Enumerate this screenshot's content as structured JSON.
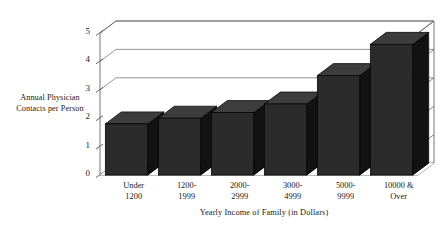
{
  "chart_data": {
    "type": "bar",
    "title": "",
    "subtitle": "",
    "xlabel": "Yearly Income of Family (in Dollars)",
    "ylabel": "Annual Physician Contacts per Person",
    "categories": [
      "Under 1200",
      "1200-1999",
      "2000-2999",
      "3000-4999",
      "5000-9999",
      "10000 & Over"
    ],
    "category_lines": [
      [
        "Under",
        "1200"
      ],
      [
        "1200-",
        "1999"
      ],
      [
        "2000-",
        "2999"
      ],
      [
        "3000-",
        "4999"
      ],
      [
        "5000-",
        "9999"
      ],
      [
        "10000 &",
        "Over"
      ]
    ],
    "values": [
      1.8,
      2.0,
      2.2,
      2.5,
      3.5,
      4.6
    ],
    "ylim": [
      0,
      5
    ],
    "yticks": [
      "0",
      "1",
      "2",
      "3",
      "4",
      "5"
    ],
    "ytick_values": [
      0,
      1,
      2,
      3,
      4,
      5
    ],
    "gridlines": [
      3,
      4,
      5
    ],
    "grid": true,
    "legend": null,
    "legend_position": "none",
    "style": "3d-bar",
    "bar_color": "#2b2b2b",
    "bar_top_color": "#3d3d3d",
    "bar_side_color": "#121212",
    "axis_color": "#555555",
    "background": "#ffffff"
  },
  "figure": {
    "caption": ""
  }
}
